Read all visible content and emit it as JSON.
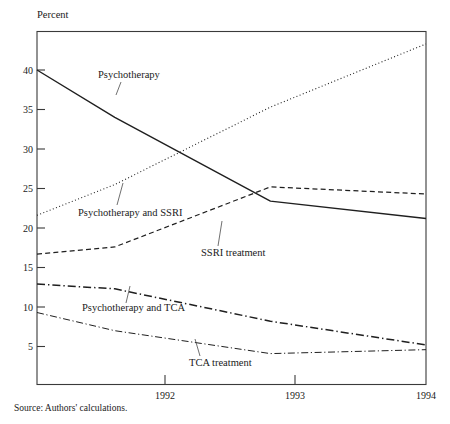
{
  "chart_data": {
    "type": "line",
    "title": "",
    "ylabel": "Percent",
    "xlabel": "",
    "x": [
      1991.5,
      1992,
      1993,
      1994
    ],
    "categories": [
      "1992",
      "1993",
      "1994"
    ],
    "xtick_labels": [
      "1992",
      "1993",
      "1994"
    ],
    "ytick_labels": [
      "5",
      "10",
      "15",
      "20",
      "25",
      "30",
      "35",
      "40"
    ],
    "ytick_values": [
      5,
      10,
      15,
      20,
      25,
      30,
      35,
      40
    ],
    "ylim": [
      0,
      45
    ],
    "xlim": [
      1991.5,
      1994
    ],
    "grid": false,
    "legend": "inline-annotations",
    "source_note": "Source: Authors' calculations.",
    "series": [
      {
        "name": "Psychotherapy",
        "style": "solid",
        "label": "Psychotherapy",
        "points": [
          {
            "x": 1991.5,
            "y": 40.0
          },
          {
            "x": 1992.0,
            "y": 34.0
          },
          {
            "x": 1993.0,
            "y": 23.4
          },
          {
            "x": 1994.0,
            "y": 21.2
          }
        ]
      },
      {
        "name": "Psychotherapy and SSRI",
        "style": "dotted",
        "label": "Psychotherapy and SSRI",
        "points": [
          {
            "x": 1991.5,
            "y": 21.6
          },
          {
            "x": 1992.0,
            "y": 25.5
          },
          {
            "x": 1993.0,
            "y": 35.3
          },
          {
            "x": 1994.0,
            "y": 43.3
          }
        ]
      },
      {
        "name": "SSRI treatment",
        "style": "dashed",
        "label": "SSRI treatment",
        "points": [
          {
            "x": 1991.5,
            "y": 16.7
          },
          {
            "x": 1992.0,
            "y": 17.6
          },
          {
            "x": 1993.0,
            "y": 25.2
          },
          {
            "x": 1994.0,
            "y": 24.3
          }
        ]
      },
      {
        "name": "Psychotherapy and TCA",
        "style": "dash-dot-heavy",
        "label": "Psychotherapy and TCA",
        "points": [
          {
            "x": 1991.5,
            "y": 12.9
          },
          {
            "x": 1992.0,
            "y": 12.3
          },
          {
            "x": 1993.0,
            "y": 8.2
          },
          {
            "x": 1994.0,
            "y": 5.2
          }
        ]
      },
      {
        "name": "TCA treatment",
        "style": "dash-dot-light",
        "label": "TCA treatment",
        "points": [
          {
            "x": 1991.5,
            "y": 9.3
          },
          {
            "x": 1992.0,
            "y": 7.0
          },
          {
            "x": 1993.0,
            "y": 4.1
          },
          {
            "x": 1994.0,
            "y": 4.6
          }
        ]
      }
    ],
    "colors": {
      "line": "#1f1f1f",
      "frame": "#3a3a3a",
      "text": "#1a1a1a",
      "background": "#ffffff"
    }
  }
}
